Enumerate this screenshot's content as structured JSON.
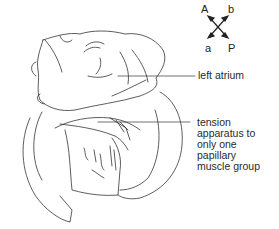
{
  "compass": {
    "top_left": "A",
    "top_right": "b",
    "bottom_left": "a",
    "bottom_right": "P"
  },
  "labels": {
    "left_atrium": "left atrium",
    "tension_apparatus": "tension\napparatus to\nonly one\npapillary\nmuscle group"
  }
}
